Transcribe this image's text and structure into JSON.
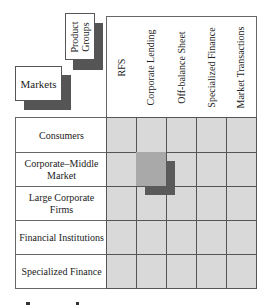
{
  "diagram": {
    "corner_labels": {
      "markets": "Markets",
      "product_groups_line1": "Product",
      "product_groups_line2": "Groups"
    },
    "columns": [
      {
        "label": "RFS"
      },
      {
        "label": "Corporate Lending"
      },
      {
        "label": "Off-balance Sheet"
      },
      {
        "label": "Specialized Finance"
      },
      {
        "label": "Market Transactions"
      }
    ],
    "rows": [
      {
        "label": "Consumers"
      },
      {
        "label": "Corporate–Middle Market"
      },
      {
        "label": "Large Corporate Firms"
      },
      {
        "label": "Financial Institutions"
      },
      {
        "label": "Specialized Finance"
      }
    ],
    "highlighted_cell": {
      "row": "Corporate–Middle Market",
      "column": "Corporate Lending"
    },
    "colors": {
      "cell_fill": "#d9d9d9",
      "highlight_fill": "#a9a9a9",
      "shadow": "#555555",
      "grid_line": "#555555"
    }
  }
}
